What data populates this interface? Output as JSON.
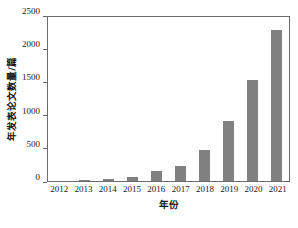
{
  "chart_data": {
    "type": "bar",
    "title": "",
    "subtitle": "",
    "xlabel": "年份",
    "ylabel": "年发表论文数量/篇",
    "categories": [
      "2012",
      "2013",
      "2014",
      "2015",
      "2016",
      "2017",
      "2018",
      "2019",
      "2020",
      "2021"
    ],
    "values": [
      2,
      8,
      25,
      60,
      145,
      230,
      470,
      905,
      1520,
      2270
    ],
    "series": [
      {
        "name": "年发表论文数量",
        "values": [
          2,
          8,
          25,
          60,
          145,
          230,
          470,
          905,
          1520,
          2270
        ]
      }
    ],
    "ylim": [
      0,
      2500
    ],
    "yticks": [
      0,
      500,
      1000,
      1500,
      2000,
      2500
    ],
    "ytick_labels": [
      "0",
      "500",
      "1000",
      "1500",
      "2000",
      "2500"
    ],
    "xtick_labels": [
      "2012",
      "2013",
      "2014",
      "2015",
      "2016",
      "2017",
      "2018",
      "2019",
      "2020",
      "2021"
    ],
    "grid": false,
    "legend": null,
    "legend_position": "none",
    "bar_color": "#808080",
    "axis_color": "#6b6b6b",
    "text_color": "#1a1a1a",
    "background": "#ffffff",
    "annotations": []
  }
}
